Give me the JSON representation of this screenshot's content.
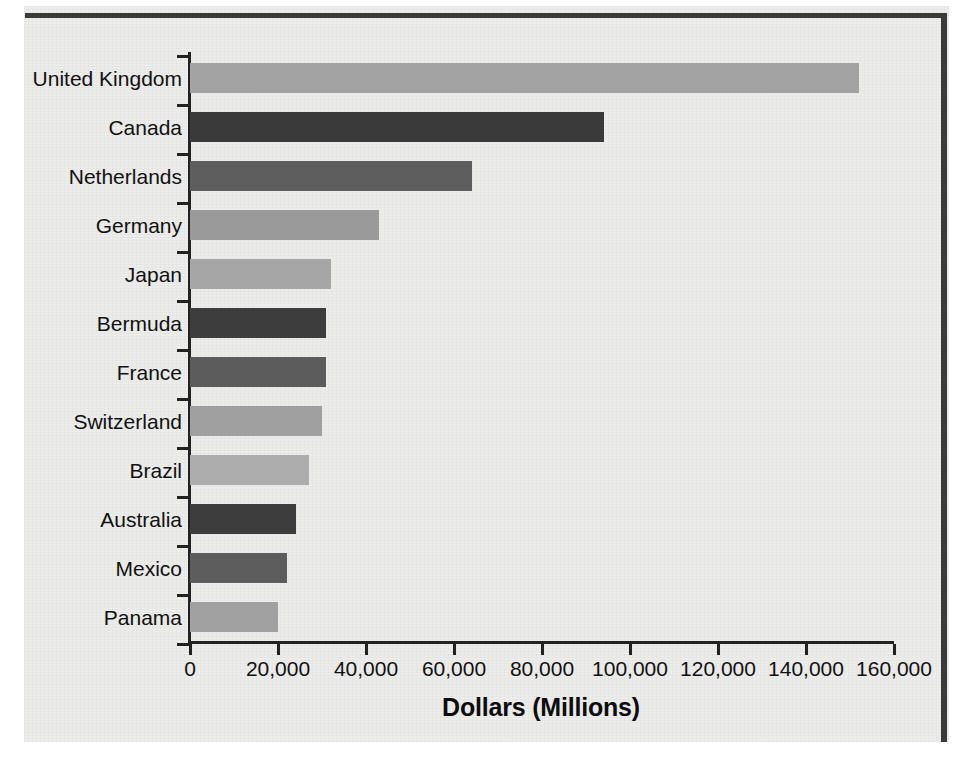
{
  "chart_data": {
    "type": "bar",
    "orientation": "horizontal",
    "title": "",
    "xlabel": "Dollars (Millions)",
    "ylabel": "",
    "xlim": [
      0,
      160000
    ],
    "xticks": [
      0,
      20000,
      40000,
      60000,
      80000,
      100000,
      120000,
      140000,
      160000
    ],
    "xtick_labels": [
      "0",
      "20,000",
      "40,000",
      "60,000",
      "80,000",
      "100,000",
      "120,000",
      "140,000",
      "160,000"
    ],
    "grid": false,
    "legend": false,
    "categories": [
      "United Kingdom",
      "Canada",
      "Netherlands",
      "Germany",
      "Japan",
      "Bermuda",
      "France",
      "Switzerland",
      "Brazil",
      "Australia",
      "Mexico",
      "Panama"
    ],
    "values": [
      152000,
      94000,
      64000,
      43000,
      32000,
      31000,
      31000,
      30000,
      27000,
      24000,
      22000,
      20000
    ],
    "bar_colors": [
      "#a3a3a3",
      "#3a3a3a",
      "#5e5e5e",
      "#9a9a9a",
      "#a6a6a6",
      "#3d3d3d",
      "#5c5c5c",
      "#a0a0a0",
      "#adadad",
      "#3c3c3c",
      "#5d5d5d",
      "#a1a1a1"
    ]
  },
  "colors": {
    "paper": "#ececeb",
    "ink": "#111111",
    "axis": "#222222",
    "border": "#3a3a3a"
  }
}
